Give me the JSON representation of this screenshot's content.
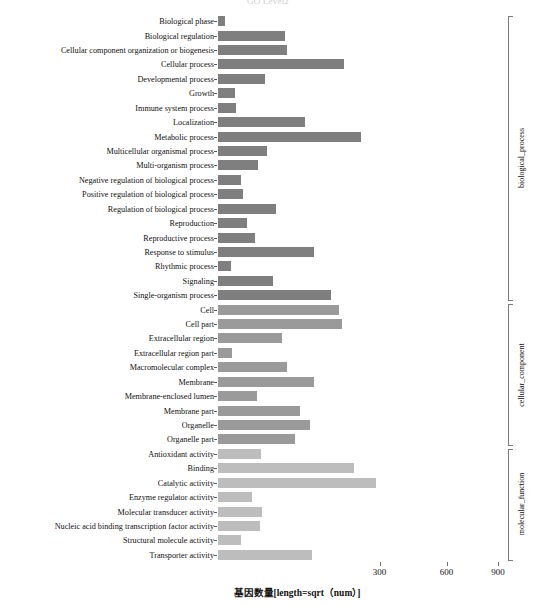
{
  "title_faint": "GO Level2",
  "chart_data": {
    "type": "bar",
    "orientation": "horizontal",
    "title": "",
    "xlabel": "基因数量[length=sqrt（num）]",
    "ylabel": "",
    "scale": "sqrt",
    "grid": false,
    "xticks": [
      300,
      600,
      900
    ],
    "xtick_labels": [
      "300",
      "600",
      "900"
    ],
    "xlim": [
      0,
      1040
    ],
    "legend_position": "right-brackets",
    "categories": [
      "Biological phase",
      "Biological regulation",
      "Cellular component organization or biogenesis",
      "Cellular process",
      "Developmental process",
      "Growth",
      "Immune system process",
      "Localization",
      "Metabolic process",
      "Multicellular organismal process",
      "Multi-organism process",
      "Negative regulation of biological process",
      "Positive regulation of biological process",
      "Regulation of biological process",
      "Reproduction",
      "Reproductive process",
      "Response to stimulus",
      "Rhythmic process",
      "Signaling",
      "Single-organism process",
      "Cell",
      "Cell part",
      "Extracellular region",
      "Extracellular region part",
      "Macromolecular complex",
      "Membrane",
      "Membrane-enclosed lumen",
      "Membrane part",
      "Organelle",
      "Organelle part",
      "Antioxidant activity",
      "Binding",
      "Catalytic activity",
      "Enzyme regulator activity",
      "Molecular transducer activity",
      "Nucleic acid binding transcription factor activity",
      "Structural molecule activity",
      "Transporter activity"
    ],
    "values": [
      3,
      215,
      220,
      662,
      112,
      18,
      20,
      340,
      830,
      118,
      84,
      30,
      34,
      160,
      46,
      72,
      390,
      12,
      145,
      510,
      605,
      632,
      182,
      13,
      225,
      390,
      70,
      285,
      360,
      243,
      92,
      760,
      1000,
      62,
      95,
      88,
      30,
      353
    ],
    "bar_lengths_px": [
      7,
      67,
      69,
      126,
      47,
      17,
      18,
      87,
      143,
      49,
      40,
      23,
      25,
      58,
      29,
      37,
      96,
      13,
      55,
      113,
      121,
      124,
      64,
      14,
      69,
      96,
      39,
      82,
      92,
      77,
      43,
      136,
      158,
      34,
      44,
      42,
      23,
      94
    ],
    "groups": [
      {
        "name": "biological_process",
        "color": "#7f7f7f",
        "start_index": 0,
        "end_index": 19
      },
      {
        "name": "cellular_component",
        "color": "#9a9a9a",
        "start_index": 20,
        "end_index": 29
      },
      {
        "name": "molecular_function",
        "color": "#bdbdbd",
        "start_index": 30,
        "end_index": 37
      }
    ]
  }
}
